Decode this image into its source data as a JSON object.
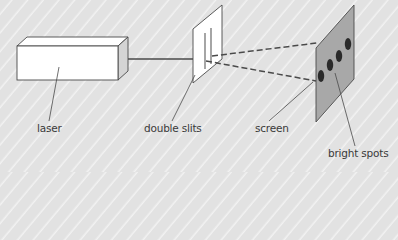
{
  "diagram": {
    "labels": {
      "laser": "laser",
      "double_slits": "double slits",
      "screen": "screen",
      "bright_spots": "bright spots"
    },
    "colors": {
      "background": "#e4e4e4",
      "stripe": "#f2f2f2",
      "line": "#4a4a4a",
      "box_face": "#ffffff",
      "box_side": "#d4d4d4",
      "screen_fill": "#a8a8a8",
      "spot": "#2a2a2a"
    },
    "bright_spot_count": 4
  }
}
